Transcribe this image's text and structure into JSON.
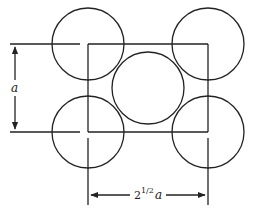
{
  "diagram": {
    "stroke_color": "#222222",
    "background": "#ffffff",
    "circles": [
      {
        "name": "top-left-atom",
        "cx": 88,
        "cy": 44,
        "r": 36
      },
      {
        "name": "top-right-atom",
        "cx": 208,
        "cy": 44,
        "r": 36
      },
      {
        "name": "center-atom",
        "cx": 148,
        "cy": 88,
        "r": 36
      },
      {
        "name": "bottom-left-atom",
        "cx": 88,
        "cy": 132,
        "r": 36
      },
      {
        "name": "bottom-right-atom",
        "cx": 208,
        "cy": 132,
        "r": 36
      }
    ],
    "square": {
      "x": 88,
      "y": 44,
      "width": 120,
      "height": 88
    },
    "labels": {
      "vertical_dimension": "a",
      "horizontal_dimension_base": "2",
      "horizontal_dimension_exponent": "1/2",
      "horizontal_dimension_var": "a"
    }
  }
}
